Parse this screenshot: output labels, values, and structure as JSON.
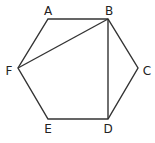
{
  "diagram": {
    "type": "geometry",
    "shape": "regular hexagon",
    "colors": {
      "stroke": "#333333",
      "fill": "#ffffff",
      "label": "#222222"
    },
    "vertices": [
      {
        "id": "A",
        "label": "A",
        "x": 48,
        "y": 19,
        "lx": 48,
        "ly": 15
      },
      {
        "id": "B",
        "label": "B",
        "x": 108,
        "y": 19,
        "lx": 109,
        "ly": 15
      },
      {
        "id": "C",
        "label": "C",
        "x": 138,
        "y": 68,
        "lx": 147,
        "ly": 75
      },
      {
        "id": "D",
        "label": "D",
        "x": 108,
        "y": 119,
        "lx": 108,
        "ly": 133
      },
      {
        "id": "E",
        "label": "E",
        "x": 48,
        "y": 119,
        "lx": 48,
        "ly": 133
      },
      {
        "id": "F",
        "label": "F",
        "x": 18,
        "y": 68,
        "lx": 9,
        "ly": 75
      }
    ],
    "edges": [
      [
        "A",
        "B"
      ],
      [
        "B",
        "C"
      ],
      [
        "C",
        "D"
      ],
      [
        "D",
        "E"
      ],
      [
        "E",
        "F"
      ],
      [
        "F",
        "A"
      ]
    ],
    "diagonals": [
      [
        "F",
        "B"
      ],
      [
        "B",
        "D"
      ]
    ]
  }
}
